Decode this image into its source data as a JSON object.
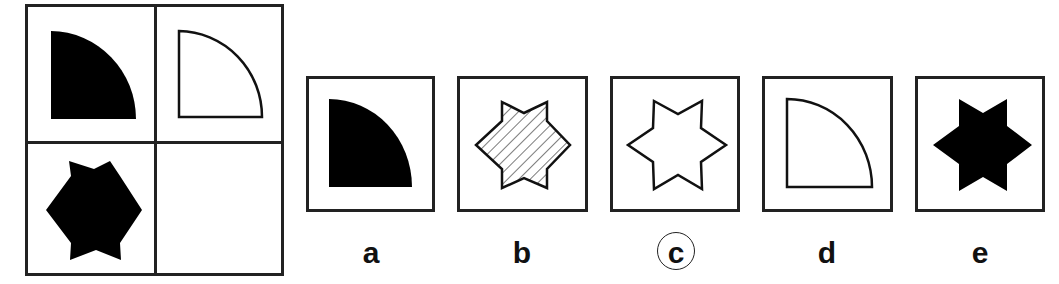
{
  "puzzle": {
    "matrix": {
      "cells": [
        {
          "position": "top-left",
          "shape": "quarter-circle",
          "fill": "solid"
        },
        {
          "position": "top-right",
          "shape": "quarter-circle",
          "fill": "outline"
        },
        {
          "position": "bottom-left",
          "shape": "six-pointed-star",
          "fill": "solid"
        },
        {
          "position": "bottom-right",
          "shape": "empty",
          "fill": "none"
        }
      ]
    },
    "options": [
      {
        "label": "a",
        "shape": "quarter-circle",
        "fill": "solid",
        "selected": false
      },
      {
        "label": "b",
        "shape": "six-pointed-star",
        "fill": "hatched",
        "selected": false
      },
      {
        "label": "c",
        "shape": "six-pointed-star",
        "fill": "outline",
        "selected": true
      },
      {
        "label": "d",
        "shape": "quarter-circle",
        "fill": "outline",
        "selected": false
      },
      {
        "label": "e",
        "shape": "six-pointed-star",
        "fill": "solid",
        "selected": false
      }
    ],
    "answer": "c"
  }
}
